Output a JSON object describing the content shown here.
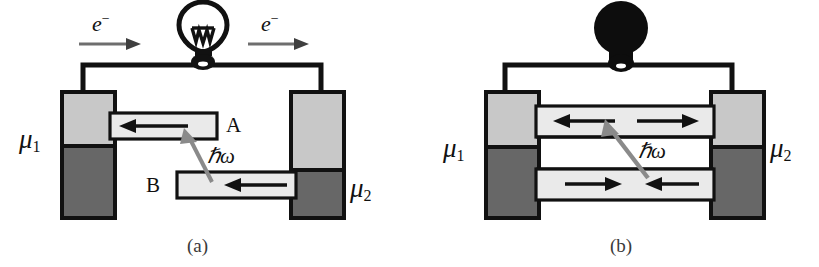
{
  "figure": {
    "caption_a": "(a)",
    "caption_b": "(b)",
    "background_color": "#ffffff",
    "ink_color": "#111111",
    "electrode_light_color": "#c8c8c8",
    "electrode_dark_color": "#676767",
    "channel_fill_color": "#eaeaea",
    "arrow_gray_color": "#6e6e6e"
  },
  "panel_a": {
    "name": "(a)",
    "bulb": {
      "icon": "lightbulb-outline-icon",
      "state": "unlit",
      "fill": "#ffffff",
      "stroke": "#111111"
    },
    "electron_labels": [
      {
        "text": "e",
        "superscript": "−",
        "direction": "right"
      },
      {
        "text": "e",
        "superscript": "−",
        "direction": "right"
      }
    ],
    "electrodes": [
      {
        "id": "left",
        "label": "μ",
        "subscript": "1",
        "label_side": "left"
      },
      {
        "id": "right",
        "label": "μ",
        "subscript": "2",
        "label_side": "right"
      }
    ],
    "channels": [
      {
        "id": "A",
        "label": "A",
        "label_side": "right",
        "arrow_direction": "left",
        "position": "upper"
      },
      {
        "id": "B",
        "label": "B",
        "label_side": "left",
        "arrow_direction": "left",
        "position": "lower"
      }
    ],
    "photon": {
      "label": "ℏω",
      "icon": "photon-arrow-icon",
      "direction": "up-left",
      "from_channel": "B",
      "to_channel": "A"
    }
  },
  "panel_b": {
    "name": "(b)",
    "bulb": {
      "icon": "lightbulb-solid-icon",
      "state": "lit",
      "fill": "#0d0d0d",
      "stroke": "#0d0d0d"
    },
    "electrodes": [
      {
        "id": "left",
        "label": "μ",
        "subscript": "1",
        "label_side": "left"
      },
      {
        "id": "right",
        "label": "μ",
        "subscript": "2",
        "label_side": "right"
      }
    ],
    "channels": [
      {
        "id": "upper",
        "position": "upper",
        "arrow_directions": [
          "left",
          "right"
        ]
      },
      {
        "id": "lower",
        "position": "lower",
        "arrow_directions": [
          "right",
          "left"
        ]
      }
    ],
    "photon": {
      "label": "ℏω",
      "icon": "photon-arrow-icon",
      "direction": "up-left",
      "from_channel": "lower",
      "to_channel": "upper"
    }
  }
}
